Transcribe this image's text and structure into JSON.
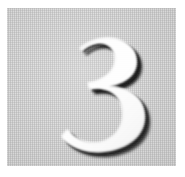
{
  "image": {
    "kind": "photograph-of-engraved-plate",
    "subject_label": "3",
    "description": "Close-up photograph of a light gray textured square plate bearing a single large embossed numeral three, white with a dark drop shadow.",
    "width_px": 185,
    "height_px": 177
  },
  "canvas": {
    "background_color": "#ffffff"
  },
  "plate": {
    "label": "gray textured plate",
    "background_color": "#c9c9c9",
    "texture": "fine 1px checkerboard dither",
    "left_px": 7,
    "top_px": 8,
    "width_px": 169,
    "height_px": 158
  },
  "numeral": {
    "character": "3",
    "style": "didone-bold-high-contrast",
    "fill_color": "#fbfbfb",
    "shadow_color": "#141414",
    "highlight_color": "#ffffff",
    "bounds": {
      "left_px": 48,
      "top_px": 26,
      "width_px": 82,
      "height_px": 116
    }
  }
}
